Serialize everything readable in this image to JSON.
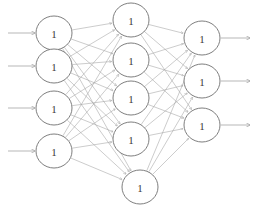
{
  "diagram": {
    "type": "neural-network",
    "title": "",
    "background_color": "#ffffff",
    "node_fill_color": "#ffffff",
    "node_stroke_color": "#6f6f6f",
    "edge_color": "#a2a2a2",
    "label_color": "#3a3a3a",
    "canvas": {
      "width": 264,
      "height": 213
    },
    "node_radius": {
      "rx": 18,
      "ry": 17
    },
    "layers": [
      {
        "id": "input-layer",
        "name": "input-layer",
        "x": 54,
        "nodes": [
          {
            "id": "input-node-1",
            "label": "1",
            "cx": 54,
            "cy": 33
          },
          {
            "id": "input-node-2",
            "label": "1",
            "cx": 54,
            "cy": 66
          },
          {
            "id": "input-node-3",
            "label": "1",
            "cx": 54,
            "cy": 108
          },
          {
            "id": "input-node-4",
            "label": "1",
            "cx": 54,
            "cy": 151
          }
        ]
      },
      {
        "id": "hidden-layer",
        "name": "hidden-layer",
        "x": 131,
        "nodes": [
          {
            "id": "hidden-node-1",
            "label": "1",
            "cx": 131,
            "cy": 20
          },
          {
            "id": "hidden-node-2",
            "label": "1",
            "cx": 131,
            "cy": 60
          },
          {
            "id": "hidden-node-3",
            "label": "1",
            "cx": 131,
            "cy": 98
          },
          {
            "id": "hidden-node-4",
            "label": "1",
            "cx": 131,
            "cy": 139
          },
          {
            "id": "hidden-node-5",
            "label": "1",
            "cx": 140,
            "cy": 187
          }
        ]
      },
      {
        "id": "output-layer",
        "name": "output-layer",
        "x": 202,
        "nodes": [
          {
            "id": "output-node-1",
            "label": "1",
            "cx": 202,
            "cy": 38
          },
          {
            "id": "output-node-2",
            "label": "1",
            "cx": 202,
            "cy": 81
          },
          {
            "id": "output-node-3",
            "label": "1",
            "cx": 202,
            "cy": 125
          }
        ]
      }
    ],
    "input_arrows": [
      {
        "id": "input-arrow-1",
        "x1": 8,
        "y1": 33,
        "x2": 35,
        "y2": 33
      },
      {
        "id": "input-arrow-2",
        "x1": 8,
        "y1": 66,
        "x2": 35,
        "y2": 66
      },
      {
        "id": "input-arrow-3",
        "x1": 8,
        "y1": 108,
        "x2": 35,
        "y2": 108
      },
      {
        "id": "input-arrow-4",
        "x1": 8,
        "y1": 151,
        "x2": 35,
        "y2": 151
      }
    ],
    "output_arrows": [
      {
        "id": "output-arrow-1",
        "x1": 221,
        "y1": 38,
        "x2": 250,
        "y2": 38
      },
      {
        "id": "output-arrow-2",
        "x1": 221,
        "y1": 81,
        "x2": 250,
        "y2": 81
      },
      {
        "id": "output-arrow-3",
        "x1": 221,
        "y1": 125,
        "x2": 250,
        "y2": 125
      }
    ],
    "connections": {
      "input_to_hidden": "fully-connected",
      "hidden_to_output": "fully-connected"
    }
  }
}
